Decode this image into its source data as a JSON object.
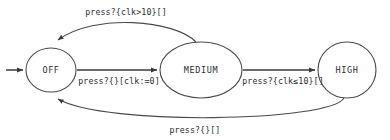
{
  "diagram": {
    "type": "finite-state-machine",
    "title": "",
    "background_color": "#ffffff",
    "stroke_color": "#4a4a4a",
    "text_color": "#2e2e2e",
    "initial_state": "OFF",
    "states": [
      {
        "id": "off",
        "label": "OFF",
        "shape": "circle",
        "cx": 51,
        "cy": 70,
        "rx": 25,
        "ry": 22
      },
      {
        "id": "medium",
        "label": "MEDIUM",
        "shape": "ellipse",
        "cx": 201,
        "cy": 70,
        "rx": 41,
        "ry": 28
      },
      {
        "id": "high",
        "label": "HIGH",
        "shape": "circle",
        "cx": 347,
        "cy": 70,
        "rx": 29,
        "ry": 28
      }
    ],
    "transitions": [
      {
        "id": "off-to-medium",
        "from": "OFF",
        "to": "MEDIUM",
        "label": "press?{}[clk:=0]",
        "event": "press?",
        "guard": "{}",
        "action": "[clk:=0]",
        "label_x": 119,
        "label_y": 81
      },
      {
        "id": "medium-to-high",
        "from": "MEDIUM",
        "to": "HIGH",
        "label": "press?{clk≤10}[]",
        "event": "press?",
        "guard": "{clk≤10}",
        "action": "[]",
        "label_x": 283,
        "label_y": 81
      },
      {
        "id": "medium-to-off",
        "from": "MEDIUM",
        "to": "OFF",
        "label": "press?{clk>10}[]",
        "event": "press?",
        "guard": "{clk>10}",
        "action": "[]",
        "label_x": 126,
        "label_y": 12
      },
      {
        "id": "high-to-off",
        "from": "HIGH",
        "to": "OFF",
        "label": "press?{}[]",
        "event": "press?",
        "guard": "{}",
        "action": "[]",
        "label_x": 195,
        "label_y": 130
      }
    ]
  }
}
